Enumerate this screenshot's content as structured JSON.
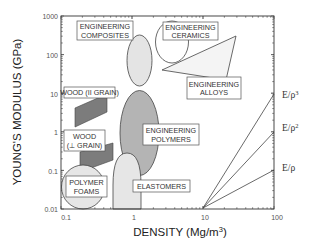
{
  "chart_data": {
    "type": "scatter",
    "title": "",
    "xlabel": "DENSITY (Mg/m³)",
    "ylabel": "YOUNG'S MODULUS (GPa)",
    "xscale": "log",
    "yscale": "log",
    "xlim": [
      0.1,
      100
    ],
    "ylim": [
      0.01,
      1000
    ],
    "x_ticks": [
      "0.1",
      "1",
      "10",
      "100"
    ],
    "y_ticks": [
      "0.01",
      "0.1",
      "1",
      "10",
      "100",
      "1000"
    ],
    "grid": false,
    "material_regions": [
      {
        "name": "ENGINEERING COMPOSITES",
        "shape": "ellipse",
        "density_range": [
          1.4,
          3.0
        ],
        "modulus_range": [
          10,
          400
        ],
        "fill": "#e4e4e4"
      },
      {
        "name": "ENGINEERING CERAMICS",
        "shape": "ellipse",
        "density_range": [
          3.2,
          9.0
        ],
        "modulus_range": [
          60,
          800
        ],
        "fill": "#ffffff"
      },
      {
        "name": "ENGINEERING ALLOYS",
        "shape": "triangle",
        "density_range": [
          4.5,
          22
        ],
        "modulus_range": [
          40,
          600
        ],
        "fill": "#f2f2f2"
      },
      {
        "name": "WOOD (II GRAIN)",
        "shape": "parallelogram",
        "density_range": [
          0.2,
          0.9
        ],
        "modulus_range": [
          1.5,
          20
        ],
        "fill": "#808080"
      },
      {
        "name": "WOOD (⊥ GRAIN)",
        "shape": "parallelogram",
        "density_range": [
          0.25,
          1.0
        ],
        "modulus_range": [
          0.05,
          1.5
        ],
        "fill": "#808080"
      },
      {
        "name": "ENGINEERING POLYMERS",
        "shape": "ellipse",
        "density_range": [
          0.9,
          2.2
        ],
        "modulus_range": [
          0.1,
          10
        ],
        "fill": "#b4b4b4"
      },
      {
        "name": "ELASTOMERS",
        "shape": "arch",
        "density_range": [
          0.75,
          1.5
        ],
        "modulus_range": [
          0.01,
          0.2
        ],
        "fill": "#e4e4e4"
      },
      {
        "name": "POLYMER FOAMS",
        "shape": "circle",
        "density_range": [
          0.15,
          0.45
        ],
        "modulus_range": [
          0.013,
          0.2
        ],
        "fill": "#e4e4e4"
      }
    ],
    "guide_lines": [
      {
        "label": "E/ρ",
        "from": [
          10,
          0.01
        ],
        "to": [
          100,
          0.1
        ],
        "slope": 1
      },
      {
        "label": "E/ρ²",
        "from": [
          10,
          0.01
        ],
        "to": [
          100,
          1
        ],
        "slope": 2
      },
      {
        "label": "E/ρ³",
        "from": [
          10,
          0.01
        ],
        "to": [
          100,
          10
        ],
        "slope": 3
      }
    ]
  },
  "labels": {
    "composites_1": "ENGINEERING",
    "composites_2": "COMPOSITES",
    "ceramics_1": "ENGINEERING",
    "ceramics_2": "CERAMICS",
    "alloys_1": "ENGINEERING",
    "alloys_2": "ALLOYS",
    "wood_parallel": "WOOD (II GRAIN)",
    "wood_perp_1": "WOOD",
    "wood_perp_2": "(⊥ GRAIN)",
    "polymers_1": "ENGINEERING",
    "polymers_2": "POLYMERS",
    "foams_1": "POLYMER",
    "foams_2": "FOAMS",
    "elastomers": "ELASTOMERS",
    "e_rho": "E/ρ",
    "e_rho2_base": "E/ρ",
    "e_rho2_sup": "2",
    "e_rho3_base": "E/ρ",
    "e_rho3_sup": "3"
  },
  "axes": {
    "xlabel_base": "DENSITY (Mg/m",
    "xlabel_sup": "3",
    "xlabel_end": ")",
    "ylabel": "YOUNG'S MODULUS (GPa)",
    "x_ticks": [
      "0.1",
      "1",
      "10",
      "100"
    ],
    "y_ticks": [
      "1000",
      "100",
      "10",
      "1",
      "0.1",
      "0.01"
    ]
  }
}
